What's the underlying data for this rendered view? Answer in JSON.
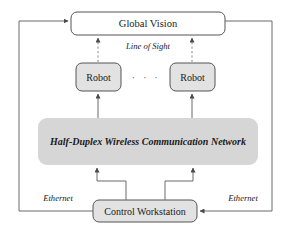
{
  "diagram": {
    "nodes": {
      "global_vision": {
        "label": "Global Vision",
        "fill": "#ffffff",
        "stroke": "#555555"
      },
      "robot_left": {
        "label": "Robot",
        "fill": "#e2e2e2",
        "stroke": "#555555"
      },
      "robot_right": {
        "label": "Robot",
        "fill": "#e2e2e2",
        "stroke": "#555555"
      },
      "network": {
        "label": "Half-Duplex Wireless Communication Network",
        "fill": "#d6d6d6",
        "stroke": "none"
      },
      "workstation": {
        "label": "Control Workstation",
        "fill": "#e2e2e2",
        "stroke": "#555555"
      }
    },
    "edge_labels": {
      "line_of_sight": "Line of Sight",
      "ethernet_left": "Ethernet",
      "ethernet_right": "Ethernet"
    },
    "ellipsis": "· · ·",
    "colors": {
      "line": "#6b6b6b",
      "dashed_line": "#8c8c8c",
      "text": "#1a1a1a",
      "band_fill": "#d6d6d6",
      "box_fill": "#e2e2e2"
    }
  }
}
